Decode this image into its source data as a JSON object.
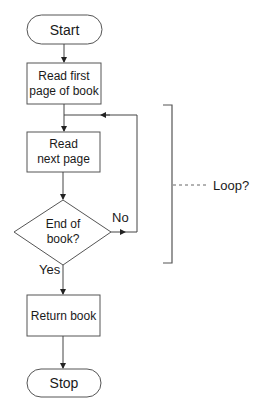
{
  "diagram": {
    "type": "flowchart",
    "nodes": {
      "start": {
        "shape": "terminal",
        "label": "Start"
      },
      "read_first": {
        "shape": "process",
        "line1": "Read first",
        "line2": "page of book"
      },
      "read_next": {
        "shape": "process",
        "line1": "Read",
        "line2": "next page"
      },
      "decision": {
        "shape": "decision",
        "line1": "End of",
        "line2": "book?"
      },
      "return_book": {
        "shape": "process",
        "label": "Return book"
      },
      "stop": {
        "shape": "terminal",
        "label": "Stop"
      }
    },
    "edges": [
      {
        "from": "start",
        "to": "read_first",
        "label": ""
      },
      {
        "from": "read_first",
        "to": "read_next",
        "label": ""
      },
      {
        "from": "read_next",
        "to": "decision",
        "label": ""
      },
      {
        "from": "decision",
        "to": "read_next",
        "label": "No"
      },
      {
        "from": "decision",
        "to": "return_book",
        "label": "Yes"
      },
      {
        "from": "return_book",
        "to": "stop",
        "label": ""
      }
    ],
    "labels": {
      "no": "No",
      "yes": "Yes"
    },
    "annotation": {
      "label": "Loop?",
      "style": "bracket with dashed leader"
    },
    "colors": {
      "stroke": "#555555",
      "text": "#1a1a1a",
      "background": "#ffffff"
    }
  }
}
